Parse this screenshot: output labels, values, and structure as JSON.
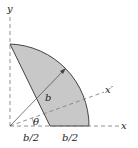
{
  "diagram": {
    "labels": {
      "x_axis": "x",
      "y_axis": "y",
      "x_prime_axis": "x′",
      "radius": "b",
      "angle": "θ",
      "left_segment": "b/2",
      "right_segment": "b/2"
    },
    "colors": {
      "fill": "#c8c8c8",
      "stroke": "#444444",
      "axis": "#777777"
    }
  }
}
